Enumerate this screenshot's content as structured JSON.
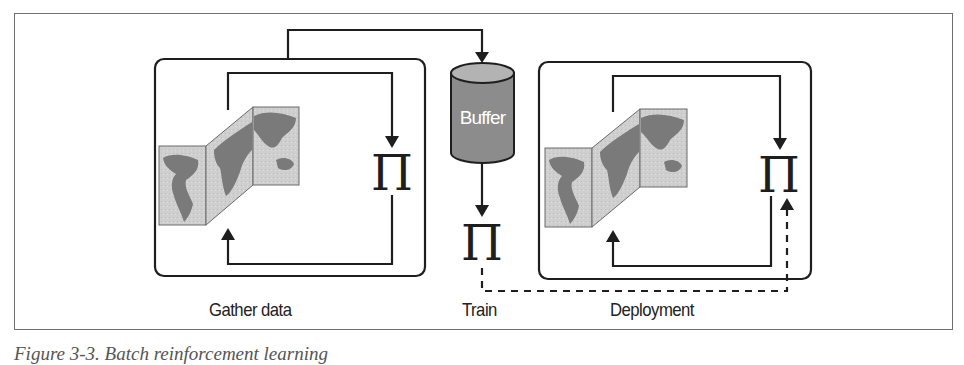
{
  "diagram": {
    "stages": [
      {
        "id": "gather",
        "label": "Gather data"
      },
      {
        "id": "train",
        "label": "Train"
      },
      {
        "id": "deploy",
        "label": "Deployment"
      }
    ],
    "buffer": {
      "label": "Buffer"
    },
    "policy_symbol": "Π",
    "environment_icon": "folded-world-map",
    "colors": {
      "line": "#1e1e1e",
      "buffer_body": "#8c8c8c",
      "buffer_top": "#b3b3b3",
      "map_bg": "#cfcfcf",
      "map_land": "#7a7a7a",
      "frame": "#6f6f6f"
    },
    "edges": [
      {
        "from": "gather",
        "to": "buffer",
        "style": "solid"
      },
      {
        "from": "buffer",
        "to": "train-policy",
        "style": "solid"
      },
      {
        "from": "train-policy",
        "to": "deploy-policy",
        "style": "dashed"
      },
      {
        "from": "environment",
        "to": "policy",
        "style": "solid",
        "loop": true
      }
    ]
  },
  "caption": "Figure 3-3. Batch reinforcement learning"
}
